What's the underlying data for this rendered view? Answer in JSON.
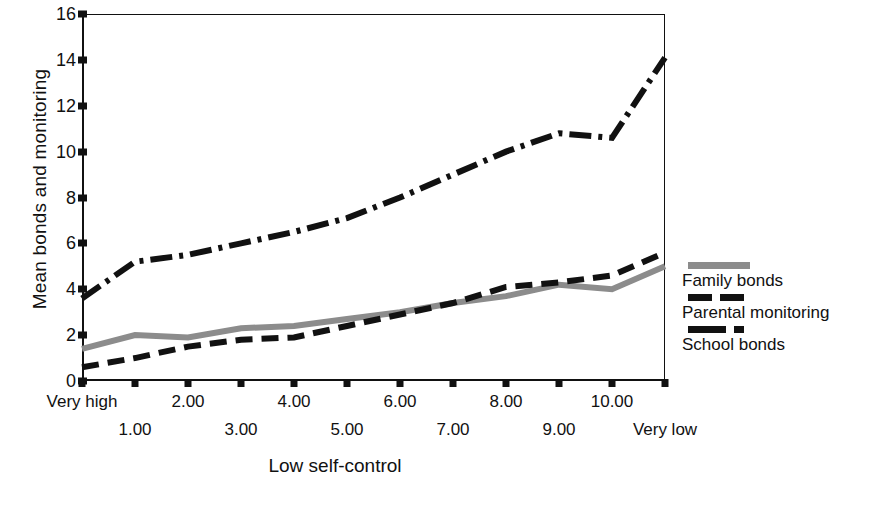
{
  "chart_data": {
    "type": "line",
    "title": "",
    "xlabel": "Low self-control",
    "ylabel": "Mean bonds and monitoring",
    "ylim": [
      0,
      16
    ],
    "yticks": [
      0,
      2,
      4,
      6,
      8,
      10,
      12,
      14,
      16
    ],
    "xtick_labels": [
      "Very high",
      "1.00",
      "2.00",
      "3.00",
      "4.00",
      "5.00",
      "6.00",
      "7.00",
      "8.00",
      "9.00",
      "10.00",
      "Very low"
    ],
    "x": [
      0,
      1,
      2,
      3,
      4,
      5,
      6,
      7,
      8,
      9,
      10,
      11
    ],
    "grid": false,
    "legend_position": "right",
    "series": [
      {
        "name": "Family bonds",
        "style": "solid",
        "color": "#8c8c8c",
        "values": [
          1.4,
          2.0,
          1.9,
          2.3,
          2.4,
          2.7,
          3.0,
          3.4,
          3.7,
          4.2,
          4.0,
          5.0
        ]
      },
      {
        "name": "Parental monitoring",
        "style": "dashed",
        "color": "#111111",
        "values": [
          0.6,
          1.0,
          1.5,
          1.8,
          1.9,
          2.4,
          2.9,
          3.4,
          4.1,
          4.3,
          4.6,
          5.6
        ]
      },
      {
        "name": "School bonds",
        "style": "dashdot",
        "color": "#111111",
        "values": [
          3.6,
          5.2,
          5.5,
          6.0,
          6.5,
          7.1,
          8.0,
          9.0,
          10.0,
          10.8,
          10.6,
          14.1
        ]
      }
    ]
  },
  "axis": {
    "ylabel": "Mean bonds and monitoring",
    "xlabel": "Low self-control"
  },
  "legend": {
    "items": [
      {
        "label": "Family bonds",
        "swatch": "solid-gray-line-swatch"
      },
      {
        "label": "Parental monitoring",
        "swatch": "dashed-black-line-swatch"
      },
      {
        "label": "School bonds",
        "swatch": "dashdot-black-line-swatch"
      }
    ]
  },
  "caption": {
    "text": ""
  }
}
